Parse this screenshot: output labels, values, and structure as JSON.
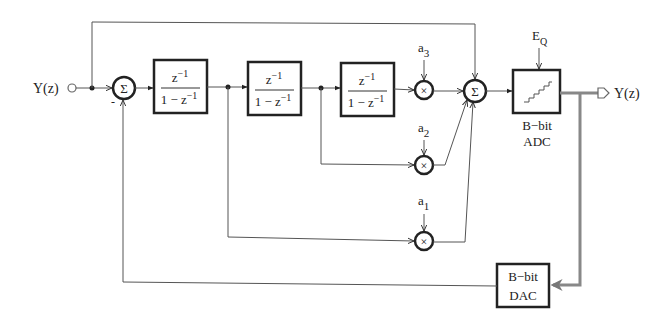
{
  "diagram": {
    "type": "sigma-delta modulator block diagram",
    "input": {
      "label": "Y(z)"
    },
    "output": {
      "label": "Y(z)"
    },
    "sum_input": {
      "symbol": "Σ",
      "minus_sign": "-"
    },
    "integrators": [
      {
        "numerator": "z",
        "num_exp": "−1",
        "denominator": "1 − z",
        "den_exp": "−1"
      },
      {
        "numerator": "z",
        "num_exp": "−1",
        "denominator": "1 − z",
        "den_exp": "−1"
      },
      {
        "numerator": "z",
        "num_exp": "−1",
        "denominator": "1 − z",
        "den_exp": "−1"
      }
    ],
    "coefficients": [
      {
        "base": "a",
        "sub": "1"
      },
      {
        "base": "a",
        "sub": "2"
      },
      {
        "base": "a",
        "sub": "3"
      }
    ],
    "multiplier_symbol": "×",
    "sum_output": {
      "symbol": "Σ"
    },
    "adc": {
      "line1": "B−bit",
      "line2": "ADC"
    },
    "quant_error": {
      "base": "E",
      "sub": "Q"
    },
    "dac": {
      "line1": "B−bit",
      "line2": "DAC"
    }
  }
}
